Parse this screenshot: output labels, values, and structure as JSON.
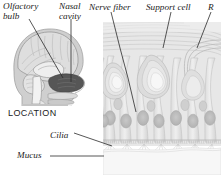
{
  "figure": {
    "title_visible": false,
    "background_color": "#ffffff",
    "ink_color": "#1b1b1b",
    "panels": [
      {
        "name": "location-panel",
        "caption": "LOCATION",
        "description": "sagittal section of human head showing brain, nasal cavity and throat"
      },
      {
        "name": "epithelium-panel",
        "description": "magnified cross-section of olfactory epithelium with receptor cells, support cells, nerve fibers, cilia and mucus layer"
      }
    ]
  },
  "labels": {
    "olfactory_bulb": "Olfactory\nbulb",
    "olfactory_bulb_line1": "Olfactory",
    "olfactory_bulb_line2": "bulb",
    "nasal_cavity_line1": "Nasal",
    "nasal_cavity_line2": "cavity",
    "nerve_fiber": "Nerve fiber",
    "support_cell": "Support cell",
    "receptor_cell": "R",
    "location": "LOCATION",
    "cilia": "Cilia",
    "mucus": "Mucus"
  },
  "colors": {
    "tissue_light": "#e9e9e9",
    "tissue_mid": "#d2d2d2",
    "tissue_dark": "#b4b4b4",
    "nucleus": "#bdbdbd",
    "head_gray": "#c9c9c9",
    "cavity_dark": "#585858",
    "leader_line": "#2a2a2a",
    "mucus_layer": "#f4f4f4"
  }
}
